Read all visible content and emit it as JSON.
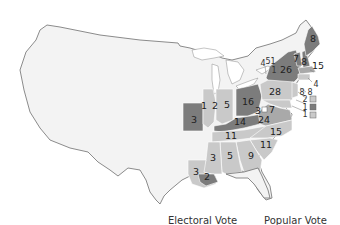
{
  "map": {
    "subject": "US presidential election electoral vote map (grayscale)",
    "colors": {
      "background": "#ffffff",
      "territory": "#f3f3f3",
      "light": "#c9c9c9",
      "medium": "#a9a9a9",
      "dark": "#7c7c7c"
    },
    "states": [
      {
        "name": "Maine",
        "votes": "8",
        "shade": "dark"
      },
      {
        "name": "New Hampshire",
        "votes": "8",
        "shade": "dark"
      },
      {
        "name": "Vermont",
        "votes": "7",
        "shade": "dark"
      },
      {
        "name": "New York",
        "votes": "26",
        "shade": "dark"
      },
      {
        "name": "Massachusetts",
        "votes": "15",
        "shade": "dark"
      },
      {
        "name": "Rhode Island",
        "votes": "4",
        "shade": "dark"
      },
      {
        "name": "Connecticut",
        "votes": "8",
        "shade": "dark"
      },
      {
        "name": "New Jersey",
        "votes": "8",
        "shade": "light"
      },
      {
        "name": "Pennsylvania",
        "votes": "28",
        "shade": "light"
      },
      {
        "name": "Delaware",
        "votes": "2",
        "shade": "light"
      },
      {
        "name": "Maryland",
        "votes": "1",
        "shade": "dark"
      },
      {
        "name": "Maryland (2)",
        "votes": "1",
        "shade": "light"
      },
      {
        "name": "Maryland (3)",
        "votes": "3",
        "shade": "light"
      },
      {
        "name": "Maryland (4)",
        "votes": "7",
        "shade": "light"
      },
      {
        "name": "Virginia",
        "votes": "24",
        "shade": "medium"
      },
      {
        "name": "North Carolina",
        "votes": "15",
        "shade": "light"
      },
      {
        "name": "South Carolina",
        "votes": "11",
        "shade": "light"
      },
      {
        "name": "Georgia",
        "votes": "9",
        "shade": "light"
      },
      {
        "name": "Alabama",
        "votes": "5",
        "shade": "light"
      },
      {
        "name": "Mississippi",
        "votes": "3",
        "shade": "light"
      },
      {
        "name": "Louisiana",
        "votes": "3",
        "shade": "light"
      },
      {
        "name": "Louisiana (2)",
        "votes": "2",
        "shade": "dark"
      },
      {
        "name": "Tennessee",
        "votes": "11",
        "shade": "light"
      },
      {
        "name": "Kentucky",
        "votes": "14",
        "shade": "dark"
      },
      {
        "name": "Ohio",
        "votes": "16",
        "shade": "dark"
      },
      {
        "name": "Indiana",
        "votes": "5",
        "shade": "light"
      },
      {
        "name": "Illinois",
        "votes": "2",
        "shade": "light"
      },
      {
        "name": "Illinois (2)",
        "votes": "1",
        "shade": "dark"
      },
      {
        "name": "Missouri",
        "votes": "3",
        "shade": "dark"
      },
      {
        "name": "New York split 1",
        "votes": "4",
        "shade": "light"
      },
      {
        "name": "New York split 2",
        "votes": "5",
        "shade": "light"
      },
      {
        "name": "New York split 3",
        "votes": "1",
        "shade": "light"
      },
      {
        "name": "New York split 4",
        "votes": "1",
        "shade": "light"
      }
    ],
    "legend": {
      "electoral_label": "Electoral Vote",
      "popular_label": "Popular Vote"
    }
  }
}
